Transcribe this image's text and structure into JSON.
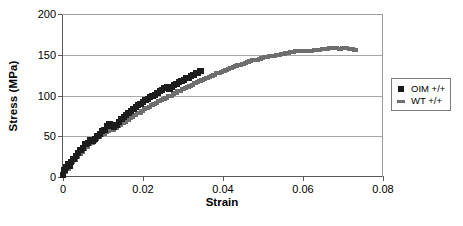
{
  "chart_data": {
    "type": "scatter",
    "title": "",
    "xlabel": "Strain",
    "ylabel": "Stress (MPa)",
    "xlim": [
      0,
      0.08
    ],
    "ylim": [
      0,
      200
    ],
    "xticks": [
      "0",
      "0.02",
      "0.04",
      "0.06",
      "0.08"
    ],
    "xtick_values": [
      0,
      0.02,
      0.04,
      0.06,
      0.08
    ],
    "yticks": [
      "0",
      "50",
      "100",
      "150",
      "200"
    ],
    "ytick_values": [
      0,
      50,
      100,
      150,
      200
    ],
    "grid": "horizontal",
    "legend_position": "right-outside",
    "series": [
      {
        "name": "OIM +/+",
        "marker": "square",
        "color": "#1c1c1c",
        "points": [
          [
            0.0,
            3
          ],
          [
            0.0004,
            8
          ],
          [
            0.0008,
            12
          ],
          [
            0.0012,
            16
          ],
          [
            0.0016,
            13
          ],
          [
            0.002,
            18
          ],
          [
            0.0026,
            22
          ],
          [
            0.0032,
            26
          ],
          [
            0.0038,
            29
          ],
          [
            0.0044,
            33
          ],
          [
            0.005,
            36
          ],
          [
            0.0056,
            40
          ],
          [
            0.0062,
            42
          ],
          [
            0.0068,
            45
          ],
          [
            0.0074,
            44
          ],
          [
            0.008,
            47
          ],
          [
            0.0086,
            50
          ],
          [
            0.0092,
            53
          ],
          [
            0.0098,
            56
          ],
          [
            0.0104,
            58
          ],
          [
            0.011,
            62
          ],
          [
            0.0116,
            65
          ],
          [
            0.0122,
            63
          ],
          [
            0.0128,
            61
          ],
          [
            0.0134,
            64
          ],
          [
            0.014,
            68
          ],
          [
            0.0146,
            71
          ],
          [
            0.0152,
            74
          ],
          [
            0.0158,
            76
          ],
          [
            0.0164,
            79
          ],
          [
            0.017,
            81
          ],
          [
            0.0176,
            84
          ],
          [
            0.0182,
            86
          ],
          [
            0.0188,
            88
          ],
          [
            0.0194,
            90
          ],
          [
            0.02,
            92
          ],
          [
            0.0206,
            94
          ],
          [
            0.0212,
            96
          ],
          [
            0.0218,
            98
          ],
          [
            0.0224,
            99
          ],
          [
            0.023,
            101
          ],
          [
            0.0236,
            103
          ],
          [
            0.0242,
            105
          ],
          [
            0.0248,
            107
          ],
          [
            0.0254,
            109
          ],
          [
            0.026,
            110
          ],
          [
            0.0266,
            108
          ],
          [
            0.0272,
            111
          ],
          [
            0.0278,
            113
          ],
          [
            0.0284,
            114
          ],
          [
            0.029,
            116
          ],
          [
            0.0296,
            118
          ],
          [
            0.0302,
            119
          ],
          [
            0.0308,
            121
          ],
          [
            0.0314,
            122
          ],
          [
            0.032,
            124
          ],
          [
            0.0326,
            125
          ],
          [
            0.0332,
            127
          ],
          [
            0.0338,
            128
          ],
          [
            0.0344,
            130
          ]
        ]
      },
      {
        "name": "WT +/+",
        "marker": "dash",
        "color": "#6e6e6e",
        "points": [
          [
            0.0,
            2
          ],
          [
            0.0006,
            6
          ],
          [
            0.0012,
            10
          ],
          [
            0.0018,
            14
          ],
          [
            0.0024,
            18
          ],
          [
            0.003,
            21
          ],
          [
            0.0036,
            25
          ],
          [
            0.0042,
            28
          ],
          [
            0.0048,
            31
          ],
          [
            0.0054,
            34
          ],
          [
            0.006,
            37
          ],
          [
            0.0066,
            40
          ],
          [
            0.0072,
            42
          ],
          [
            0.0078,
            44
          ],
          [
            0.0084,
            47
          ],
          [
            0.009,
            49
          ],
          [
            0.0096,
            51
          ],
          [
            0.0102,
            53
          ],
          [
            0.0108,
            55
          ],
          [
            0.0114,
            57
          ],
          [
            0.012,
            59
          ],
          [
            0.0126,
            58
          ],
          [
            0.0132,
            60
          ],
          [
            0.0138,
            62
          ],
          [
            0.0144,
            64
          ],
          [
            0.015,
            66
          ],
          [
            0.0156,
            68
          ],
          [
            0.0162,
            70
          ],
          [
            0.0168,
            72
          ],
          [
            0.0174,
            74
          ],
          [
            0.018,
            76
          ],
          [
            0.0186,
            78
          ],
          [
            0.0192,
            79
          ],
          [
            0.0198,
            81
          ],
          [
            0.0204,
            83
          ],
          [
            0.021,
            85
          ],
          [
            0.0216,
            86
          ],
          [
            0.0222,
            88
          ],
          [
            0.0228,
            90
          ],
          [
            0.0234,
            91
          ],
          [
            0.024,
            93
          ],
          [
            0.0246,
            94
          ],
          [
            0.0252,
            96
          ],
          [
            0.0258,
            97
          ],
          [
            0.0264,
            99
          ],
          [
            0.027,
            100
          ],
          [
            0.0276,
            102
          ],
          [
            0.0282,
            103
          ],
          [
            0.0288,
            105
          ],
          [
            0.0294,
            106
          ],
          [
            0.03,
            108
          ],
          [
            0.0306,
            109
          ],
          [
            0.0312,
            111
          ],
          [
            0.0318,
            112
          ],
          [
            0.0324,
            113
          ],
          [
            0.033,
            115
          ],
          [
            0.0336,
            116
          ],
          [
            0.0342,
            118
          ],
          [
            0.0348,
            119
          ],
          [
            0.0354,
            120
          ],
          [
            0.036,
            122
          ],
          [
            0.0366,
            123
          ],
          [
            0.0372,
            124
          ],
          [
            0.0378,
            125
          ],
          [
            0.0384,
            127
          ],
          [
            0.039,
            128
          ],
          [
            0.0396,
            129
          ],
          [
            0.0402,
            130
          ],
          [
            0.0408,
            131
          ],
          [
            0.0414,
            133
          ],
          [
            0.042,
            134
          ],
          [
            0.0426,
            135
          ],
          [
            0.0432,
            136
          ],
          [
            0.0438,
            137
          ],
          [
            0.0444,
            138
          ],
          [
            0.045,
            139
          ],
          [
            0.0456,
            140
          ],
          [
            0.0462,
            141
          ],
          [
            0.0468,
            142
          ],
          [
            0.0474,
            143
          ],
          [
            0.048,
            143
          ],
          [
            0.0486,
            144
          ],
          [
            0.0492,
            145
          ],
          [
            0.0498,
            146
          ],
          [
            0.0504,
            147
          ],
          [
            0.051,
            147
          ],
          [
            0.0516,
            148
          ],
          [
            0.0522,
            149
          ],
          [
            0.0528,
            149
          ],
          [
            0.0534,
            150
          ],
          [
            0.054,
            150
          ],
          [
            0.0546,
            151
          ],
          [
            0.0552,
            151
          ],
          [
            0.0558,
            152
          ],
          [
            0.0564,
            152
          ],
          [
            0.057,
            153
          ],
          [
            0.0576,
            153
          ],
          [
            0.0582,
            154
          ],
          [
            0.0588,
            154
          ],
          [
            0.0594,
            154
          ],
          [
            0.06,
            155
          ],
          [
            0.061,
            155
          ],
          [
            0.062,
            155
          ],
          [
            0.063,
            156
          ],
          [
            0.064,
            156
          ],
          [
            0.065,
            157
          ],
          [
            0.066,
            157
          ],
          [
            0.0668,
            158
          ],
          [
            0.0676,
            158
          ],
          [
            0.0684,
            158
          ],
          [
            0.0692,
            157
          ],
          [
            0.07,
            158
          ],
          [
            0.0708,
            158
          ],
          [
            0.0716,
            157
          ],
          [
            0.0724,
            157
          ],
          [
            0.073,
            156
          ]
        ]
      }
    ]
  },
  "legend": {
    "items": [
      {
        "label": "OIM +/+",
        "key": "square-marker"
      },
      {
        "label": "WT +/+",
        "key": "dash-marker"
      }
    ]
  }
}
